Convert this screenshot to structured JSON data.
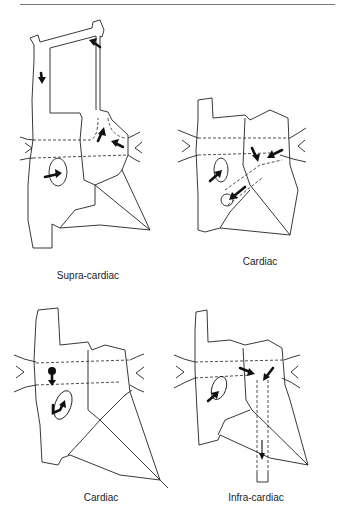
{
  "figure": {
    "panels": [
      {
        "id": "supra-cardiac",
        "label": "Supra-cardiac"
      },
      {
        "id": "cardiac-coronary-sinus",
        "label": "Cardiac"
      },
      {
        "id": "cardiac-right-atrium",
        "label": "Cardiac"
      },
      {
        "id": "infra-cardiac",
        "label": "Infra-cardiac"
      }
    ]
  }
}
